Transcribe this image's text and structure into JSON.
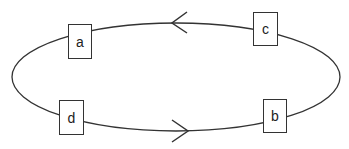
{
  "diagram": {
    "type": "cycle",
    "stroke_color": "#333333",
    "nodes": [
      {
        "id": "a",
        "label": "a"
      },
      {
        "id": "c",
        "label": "c"
      },
      {
        "id": "d",
        "label": "d"
      },
      {
        "id": "b",
        "label": "b"
      }
    ],
    "arrows": [
      {
        "position": "top",
        "direction": "left"
      },
      {
        "position": "bottom",
        "direction": "right"
      }
    ]
  }
}
